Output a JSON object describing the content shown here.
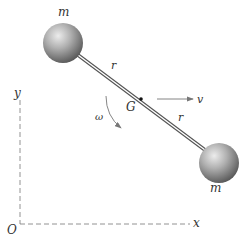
{
  "diagram": {
    "type": "rigid body — dumbbell (two masses on rod)",
    "labels": {
      "mass_top": "m",
      "mass_bottom": "m",
      "rod_top": "r",
      "rod_bottom": "r",
      "center": "G",
      "velocity": "v",
      "angular_velocity": "ω",
      "y_axis": "y",
      "x_axis": "x",
      "origin": "O"
    },
    "colors": {
      "ball_light": "#e8e8e8",
      "ball_mid": "#a9a9a9",
      "ball_dark": "#5e5e5e",
      "line": "#555555",
      "text": "#333333",
      "axis": "#777777"
    }
  }
}
